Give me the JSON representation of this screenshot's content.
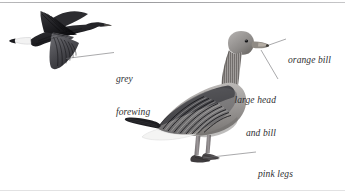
{
  "plate": {
    "title": "goose-identification-plate",
    "background": "#ffffff",
    "rule_color": "#9a9a9d",
    "ink_color": "#2e2e30",
    "leader_color": "#6e6e72"
  },
  "labels": [
    {
      "id": "grey-forewing",
      "text_lines": [
        "grey",
        "forewing"
      ],
      "align": "left",
      "x": 116,
      "y": 56
    },
    {
      "id": "orange-bill",
      "text_lines": [
        "orange bill"
      ],
      "align": "left",
      "x": 288,
      "y": 36
    },
    {
      "id": "large-head-and-bill",
      "text_lines": [
        "large head",
        "and bill"
      ],
      "align": "right",
      "x": 276,
      "y": 76
    },
    {
      "id": "pink-legs",
      "text_lines": [
        "pink legs"
      ],
      "align": "left",
      "x": 258,
      "y": 155
    }
  ],
  "birds": {
    "flying": {
      "name": "goose-in-flight",
      "pose": "flying-left",
      "features": [
        "dark upper wing",
        "grey forewing",
        "white tail band",
        "dark primaries"
      ]
    },
    "standing": {
      "name": "goose-standing",
      "pose": "standing-right",
      "features": [
        "orange bill",
        "large rounded head",
        "barred flank feathers",
        "white undertail",
        "pink legs",
        "webbed feet"
      ]
    }
  },
  "palette": {
    "dark": "#232326",
    "mid_dark": "#4a4a4e",
    "mid": "#76767b",
    "light": "#a9a9ad",
    "pale": "#d2d2d4",
    "paper": "#ffffff",
    "bill": "#8e8a86",
    "leg": "#8a868a"
  }
}
